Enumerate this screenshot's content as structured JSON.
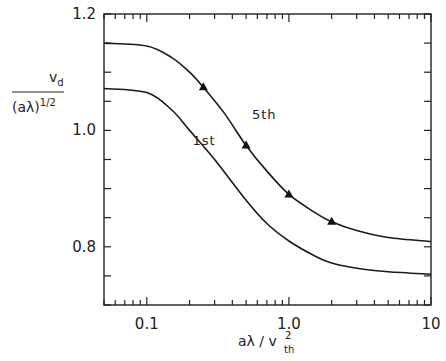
{
  "chart_data": {
    "type": "line",
    "title": "",
    "xlabel": "aλ / v_th^2",
    "ylabel": "v_d / (aλ)^1/2",
    "xscale": "log",
    "xlim": [
      0.05,
      10
    ],
    "ylim": [
      0.7,
      1.2
    ],
    "grid": false,
    "legend": "inline labels",
    "x_ticks": [
      {
        "value": 0.1,
        "label": "0.1"
      },
      {
        "value": 1.0,
        "label": "1.0"
      },
      {
        "value": 10,
        "label": "10"
      }
    ],
    "y_ticks": [
      {
        "value": 1.2,
        "label": "1.2"
      },
      {
        "value": 1.0,
        "label": "1.0"
      },
      {
        "value": 0.8,
        "label": "0.8"
      }
    ],
    "y_minor_step": 0.05,
    "series": [
      {
        "name": "5th",
        "x": [
          0.05,
          0.1,
          0.15,
          0.2,
          0.25,
          0.35,
          0.5,
          0.7,
          1.0,
          1.5,
          2.0,
          3.0,
          5.0,
          10.0
        ],
        "y": [
          1.15,
          1.145,
          1.125,
          1.1,
          1.074,
          1.03,
          0.974,
          0.93,
          0.89,
          0.86,
          0.843,
          0.828,
          0.816,
          0.809
        ],
        "markers": {
          "shape": "triangle",
          "x": [
            0.25,
            0.5,
            1.0,
            2.0
          ],
          "y": [
            1.074,
            0.974,
            0.89,
            0.843
          ]
        },
        "label_pos": {
          "x": 0.55,
          "y": 1.02
        }
      },
      {
        "name": "1st",
        "x": [
          0.05,
          0.1,
          0.15,
          0.2,
          0.3,
          0.5,
          0.7,
          1.0,
          1.5,
          2.0,
          3.0,
          5.0,
          10.0
        ],
        "y": [
          1.072,
          1.065,
          1.035,
          1.0,
          0.95,
          0.88,
          0.84,
          0.81,
          0.785,
          0.772,
          0.763,
          0.757,
          0.753
        ],
        "label_pos": {
          "x": 0.21,
          "y": 0.975
        }
      }
    ]
  },
  "labels": {
    "y_axis_numerator": "v",
    "y_axis_numerator_sub": "d",
    "y_axis_denominator": "(aλ)",
    "y_axis_denominator_sup": "1/2",
    "x_axis_main": "aλ / v",
    "x_axis_sup": "2",
    "x_axis_sub": "th"
  }
}
